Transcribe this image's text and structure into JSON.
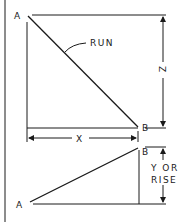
{
  "diagram": {
    "top_figure": {
      "point_a_label": "A",
      "point_b_label": "B",
      "diagonal_label": "RUN",
      "vertical_dimension_label": "Z",
      "horizontal_dimension_label": "X"
    },
    "bottom_figure": {
      "point_a_label": "A",
      "point_b_label": "B",
      "vertical_dimension_label_line1": "Y OR",
      "vertical_dimension_label_line2": "RISE"
    },
    "colors": {
      "line": "#1a1a1a",
      "background": "#ffffff"
    }
  }
}
